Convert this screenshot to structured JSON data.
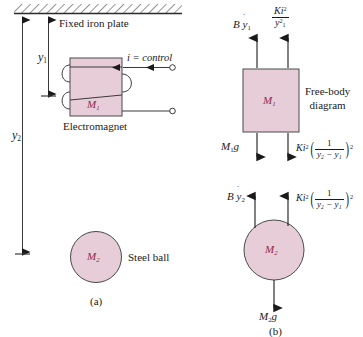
{
  "figure": {
    "title_a": "(a)",
    "title_b": "(b)",
    "colors": {
      "fill": "#e6cdd8",
      "outline": "#4a4a4a",
      "mass_label": "#8c2b4a",
      "text": "#1a1a1a"
    }
  },
  "schematic": {
    "plate_label": "Fixed iron plate",
    "dim_y1": "y",
    "dim_y1_sub": "1",
    "dim_y2": "y",
    "dim_y2_sub": "2",
    "magnet_mass": "M",
    "magnet_mass_sub": "1",
    "magnet_label": "Electromagnet",
    "current_label": "i = control",
    "ball_mass": "M",
    "ball_mass_sub": "2",
    "ball_label": "Steel ball",
    "caption": "(a)"
  },
  "free_body": {
    "title_line1": "Free-body",
    "title_line2": "diagram",
    "caption": "(b)",
    "body1": {
      "mass": "M",
      "mass_sub": "1",
      "force_damping": "B",
      "force_damping_var": "y",
      "force_damping_sub": "1",
      "force_magnetic_num": "Ki",
      "force_magnetic_num_sup": "2",
      "force_magnetic_den": "y",
      "force_magnetic_den_sub": "1",
      "force_magnetic_den_sup": "2",
      "force_weight": "M",
      "force_weight_sub": "1",
      "force_weight_g": "g",
      "force_gap_coef": "Ki",
      "force_gap_coef_sup": "2",
      "force_gap_num": "1",
      "force_gap_den": "y₂ − y₁",
      "force_gap_outer_sup": "2"
    },
    "body2": {
      "mass": "M",
      "mass_sub": "2",
      "force_damping": "B",
      "force_damping_var": "y",
      "force_damping_sub": "2",
      "force_gap_coef": "Ki",
      "force_gap_coef_sup": "2",
      "force_gap_num": "1",
      "force_gap_den": "y₂ − y₁",
      "force_gap_outer_sup": "2",
      "force_weight": "M",
      "force_weight_sub": "2",
      "force_weight_g": "g"
    }
  }
}
